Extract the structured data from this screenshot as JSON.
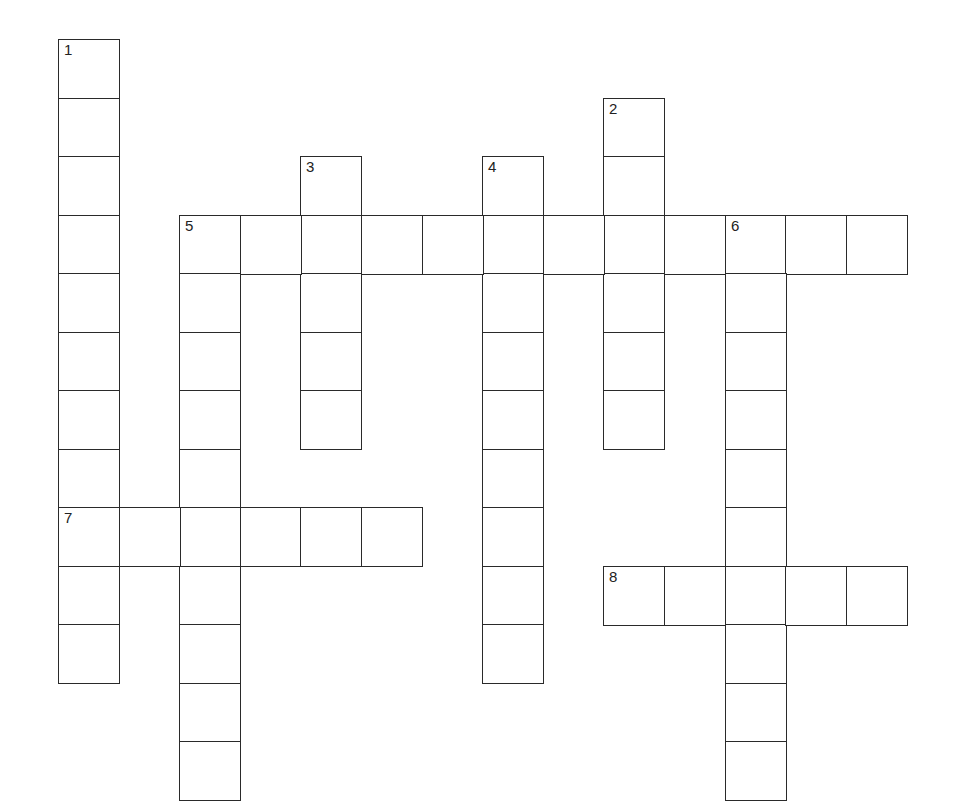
{
  "puzzle": {
    "type": "crossword",
    "grid": {
      "origin_x": 58,
      "origin_y": 39,
      "cell_w": 60.6,
      "cell_h": 58.5
    },
    "entries": [
      {
        "number": "1",
        "direction": "down",
        "row": 0,
        "col": 0,
        "length": 11
      },
      {
        "number": "2",
        "direction": "down",
        "row": 1,
        "col": 9,
        "length": 6
      },
      {
        "number": "3",
        "direction": "down",
        "row": 2,
        "col": 4,
        "length": 5
      },
      {
        "number": "4",
        "direction": "down",
        "row": 2,
        "col": 7,
        "length": 9
      },
      {
        "number": "5",
        "direction": "across",
        "row": 3,
        "col": 2,
        "length": 12
      },
      {
        "number": "5",
        "direction": "down",
        "row": 3,
        "col": 2,
        "length": 10
      },
      {
        "number": "6",
        "direction": "down",
        "row": 3,
        "col": 11,
        "length": 10
      },
      {
        "number": "7",
        "direction": "across",
        "row": 8,
        "col": 0,
        "length": 6
      },
      {
        "number": "8",
        "direction": "across",
        "row": 9,
        "col": 9,
        "length": 5
      }
    ]
  }
}
